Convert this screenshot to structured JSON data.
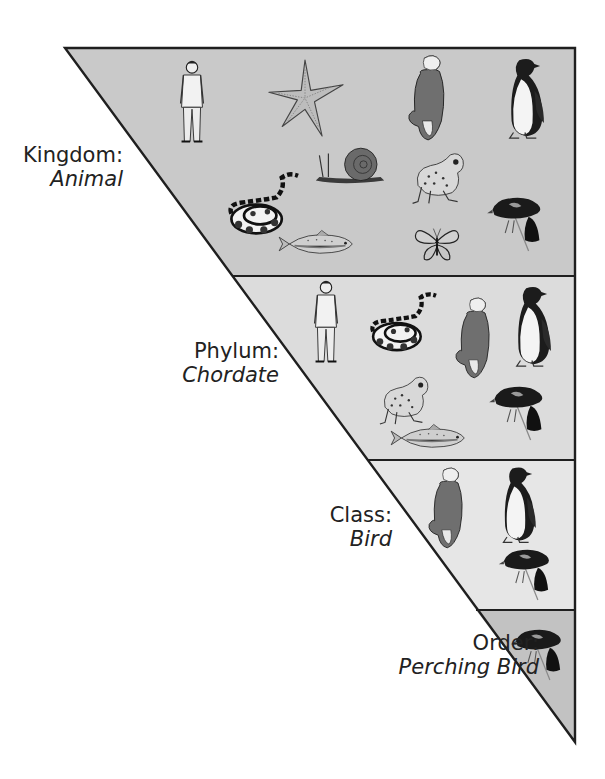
{
  "colors": {
    "kingdom_fill": "#c9c9c9",
    "phylum_fill": "#dcdcdc",
    "class_fill": "#e6e6e6",
    "order_fill": "#c2c2c2",
    "outline": "#1f1f1f",
    "ink": "#222222"
  },
  "levels": [
    {
      "rank": "Kingdom:",
      "taxon": "Animal",
      "members": [
        "human",
        "starfish",
        "eagle",
        "penguin",
        "snail",
        "frog",
        "snake",
        "blackbird",
        "fish",
        "butterfly"
      ]
    },
    {
      "rank": "Phylum:",
      "taxon": "Chordate",
      "members": [
        "human",
        "snake",
        "eagle",
        "penguin",
        "frog",
        "blackbird",
        "fish"
      ]
    },
    {
      "rank": "Class:",
      "taxon": "Bird",
      "members": [
        "eagle",
        "penguin",
        "blackbird"
      ]
    },
    {
      "rank": "Order:",
      "taxon": "Perching Bird",
      "members": [
        "blackbird"
      ]
    }
  ]
}
